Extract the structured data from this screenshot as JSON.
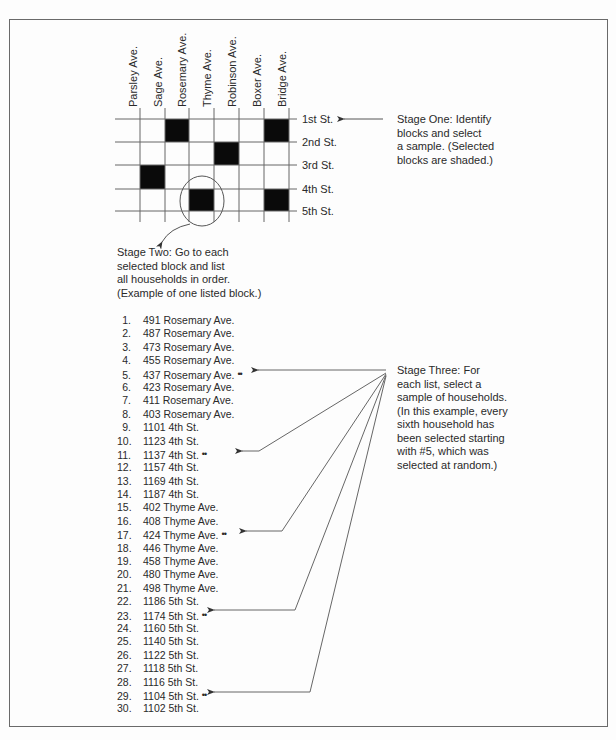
{
  "grid": {
    "avenues": [
      "Parsley Ave.",
      "Sage Ave.",
      "Rosemary Ave.",
      "Thyme Ave.",
      "Robinson Ave.",
      "Boxer Ave.",
      "Bridge Ave."
    ],
    "streets": [
      "1st St.",
      "2nd St.",
      "3rd St.",
      "4th St.",
      "5th St."
    ],
    "selected_blocks": [
      {
        "row": 0,
        "col": 2
      },
      {
        "row": 0,
        "col": 6
      },
      {
        "row": 1,
        "col": 4
      },
      {
        "row": 2,
        "col": 1
      },
      {
        "row": 3,
        "col": 3
      },
      {
        "row": 3,
        "col": 6
      }
    ]
  },
  "stage_one": {
    "text": "Stage One:  Identify\nblocks and select\na sample. (Selected\nblocks are shaded.)"
  },
  "stage_two": {
    "text": "Stage Two:  Go to each\nselected block and list\nall households in order.\n(Example of one listed block.)"
  },
  "stage_three": {
    "text": "Stage Three:  For\neach list, select a\nsample of households.\n(In this example, every\nsixth household has\nbeen selected starting\nwith #5, which was\nselected at random.)"
  },
  "selection_marker": "••",
  "households": [
    {
      "num": "1.",
      "addr": "491 Rosemary Ave."
    },
    {
      "num": "2.",
      "addr": "487 Rosemary Ave."
    },
    {
      "num": "3.",
      "addr": "473 Rosemary Ave."
    },
    {
      "num": "4.",
      "addr": "455 Rosemary Ave."
    },
    {
      "num": "5.",
      "addr": "437 Rosemary Ave.",
      "selected": true
    },
    {
      "num": "6.",
      "addr": "423 Rosemary Ave."
    },
    {
      "num": "7.",
      "addr": "411 Rosemary Ave."
    },
    {
      "num": "8.",
      "addr": "403 Rosemary Ave."
    },
    {
      "num": "9.",
      "addr": "1101 4th St."
    },
    {
      "num": "10.",
      "addr": "1123 4th St."
    },
    {
      "num": "11.",
      "addr": "1137 4th St.",
      "selected": true
    },
    {
      "num": "12.",
      "addr": "1157 4th St."
    },
    {
      "num": "13.",
      "addr": "1169 4th St."
    },
    {
      "num": "14.",
      "addr": "1187 4th St."
    },
    {
      "num": "15.",
      "addr": "402 Thyme Ave."
    },
    {
      "num": "16.",
      "addr": "408 Thyme Ave."
    },
    {
      "num": "17.",
      "addr": "424 Thyme Ave.",
      "selected": true
    },
    {
      "num": "18.",
      "addr": "446 Thyme Ave."
    },
    {
      "num": "19.",
      "addr": "458 Thyme Ave."
    },
    {
      "num": "20.",
      "addr": "480 Thyme Ave."
    },
    {
      "num": "21.",
      "addr": "498 Thyme Ave."
    },
    {
      "num": "22.",
      "addr": "1186 5th St."
    },
    {
      "num": "23.",
      "addr": "1174 5th St.",
      "selected": true
    },
    {
      "num": "24.",
      "addr": "1160 5th St."
    },
    {
      "num": "25.",
      "addr": "1140 5th St."
    },
    {
      "num": "26.",
      "addr": "1122 5th St."
    },
    {
      "num": "27.",
      "addr": "1118 5th St."
    },
    {
      "num": "28.",
      "addr": "1116 5th St."
    },
    {
      "num": "29.",
      "addr": "1104 5th St.",
      "selected": true
    },
    {
      "num": "30.",
      "addr": "1102 5th St."
    }
  ],
  "colors": {
    "line": "#555555",
    "block": "#0a0a0a",
    "text": "#2a2a2a",
    "border": "#6a6a6a"
  }
}
